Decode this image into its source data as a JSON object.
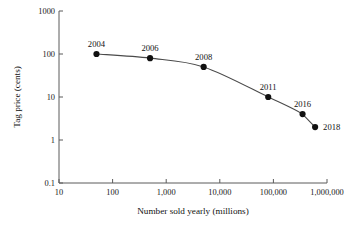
{
  "chart_data": {
    "type": "line",
    "title": "",
    "xlabel": "Number sold yearly (millions)",
    "ylabel": "Tag price (cents)",
    "xscale": "log",
    "yscale": "log",
    "xlim": [
      10,
      1000000
    ],
    "ylim": [
      0.1,
      1000
    ],
    "grid": false,
    "legend": false,
    "xticks": [
      10,
      100,
      1000,
      10000,
      100000,
      1000000
    ],
    "xticklabels": [
      "10",
      "100",
      "1,000",
      "10,000",
      "100,000",
      "1,000,000"
    ],
    "yticks": [
      0.1,
      1,
      10,
      100,
      1000
    ],
    "yticklabels": [
      "0.1",
      "1",
      "10",
      "100",
      "1000"
    ],
    "series": [
      {
        "name": "RFID tag price",
        "x": [
          50,
          500,
          5000,
          80000,
          350000,
          600000
        ],
        "y": [
          100,
          80,
          50,
          10,
          4,
          2
        ],
        "point_labels": [
          "2004",
          "2006",
          "2008",
          "2011",
          "2016",
          "2018"
        ],
        "label_positions": [
          "above",
          "above",
          "above",
          "above",
          "above",
          "right"
        ],
        "marker": "circle",
        "marker_color": "#111111",
        "line_color": "#4a4a4a"
      }
    ]
  },
  "axes": {
    "y_title": "Tag price (cents)",
    "x_title": "Number sold yearly (millions)",
    "y_tick_labels": [
      "1000",
      "100",
      "10",
      "1",
      "0.1"
    ],
    "x_tick_labels": [
      "10",
      "100",
      "1,000",
      "10,000",
      "100,000",
      "1,000,000"
    ]
  },
  "annotations": {
    "p0": "2004",
    "p1": "2006",
    "p2": "2008",
    "p3": "2011",
    "p4": "2016",
    "p5": "2018"
  },
  "colors": {
    "marker": "#111111",
    "line": "#4a4a4a",
    "axis": "#5a5a5a",
    "text": "#1a1a1a",
    "background": "#ffffff"
  }
}
